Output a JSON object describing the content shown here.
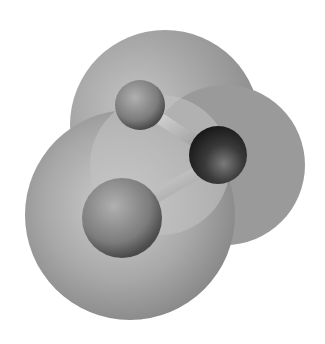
{
  "figure": {
    "atoms": [
      {
        "name": "upper-terminal-atom",
        "cx": 140,
        "cy": 105,
        "r": 25,
        "color": "#8a8a8a"
      },
      {
        "name": "central-atom",
        "cx": 218,
        "cy": 155,
        "r": 29,
        "color": "#3a3a3a"
      },
      {
        "name": "lower-terminal-atom",
        "cx": 122,
        "cy": 218,
        "r": 40,
        "color": "#7a7a7a"
      }
    ],
    "colors": {
      "background": "#ffffff",
      "surface_light": "#c8c8c8",
      "surface_dark": "#8c8c8c",
      "bond": "#b5b5b5"
    }
  }
}
